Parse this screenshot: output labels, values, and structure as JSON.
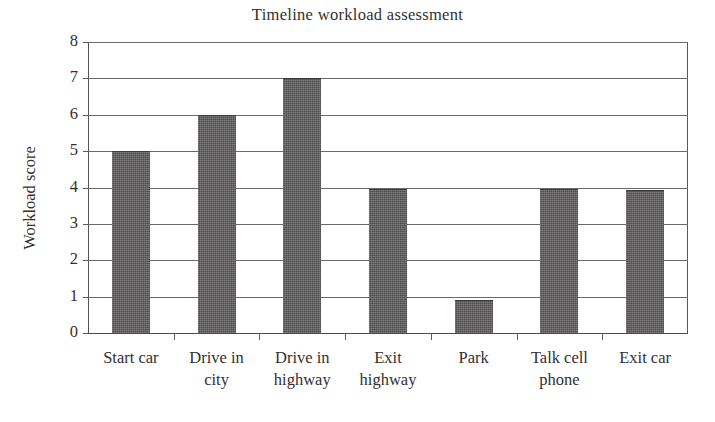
{
  "chart_data": {
    "type": "bar",
    "title": "Timeline workload assessment",
    "xlabel": "",
    "ylabel": "Workload score",
    "categories": [
      "Start car",
      "Drive in city",
      "Drive in highway",
      "Exit highway",
      "Park",
      "Talk cell phone",
      "Exit car"
    ],
    "category_lines": [
      [
        "Start car"
      ],
      [
        "Drive in",
        "city"
      ],
      [
        "Drive in",
        "highway"
      ],
      [
        "Exit",
        "highway"
      ],
      [
        "Park"
      ],
      [
        "Talk cell",
        "phone"
      ],
      [
        "Exit car"
      ]
    ],
    "values": [
      5,
      6,
      7,
      3.95,
      0.92,
      3.95,
      3.93
    ],
    "ylim": [
      0,
      8
    ],
    "ytick_labels": [
      "0",
      "1",
      "2",
      "3",
      "4",
      "5",
      "6",
      "7",
      "8"
    ],
    "ytick_values": [
      0,
      1,
      2,
      3,
      4,
      5,
      6,
      7,
      8
    ],
    "grid": true,
    "legend": "none",
    "bar_color": "#4d4b4b",
    "axis_color": "#5a5858",
    "text_color": "#333030",
    "background_color": "#ffffff"
  }
}
